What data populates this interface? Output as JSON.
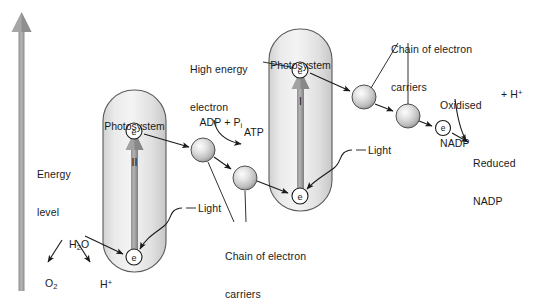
{
  "figure": {
    "background_color": "#ffffff",
    "ink_color": "#1a1a1a",
    "box_fill_light": "#f2f2f2",
    "box_fill_dark": "#c9c9c9",
    "box_stroke": "#555555",
    "sphere_fill": "#cfcfcf",
    "sphere_highlight": "#f0f0f0",
    "arrow_gray": "#9a9a9a"
  },
  "axis": {
    "label_line1": "Energy",
    "label_line2": "level",
    "icon": "upward-arrow-icon"
  },
  "photosystems": [
    {
      "id": "photosystem-ii",
      "name_line1": "Photosystem",
      "name_line2": "II",
      "electron_top_label": "e",
      "electron_bottom_label": "e",
      "internal_arrow": "excitation-arrow-up"
    },
    {
      "id": "photosystem-i",
      "name_line1": "Photosystem",
      "name_line2": "I",
      "electron_top_label": "e",
      "electron_bottom_label": "e",
      "internal_arrow": "excitation-arrow-up"
    }
  ],
  "labels": {
    "high_energy_electron_line1": "High energy",
    "high_energy_electron_line2": "electron",
    "adp_pi": "ADP + P",
    "adp_pi_subscript": "i",
    "atp": "ATP",
    "chain_left_line1": "Chain of electron",
    "chain_left_line2": "carriers",
    "chain_right_line1": "Chain of electron",
    "chain_right_line2": "carriers",
    "light_left": "Light",
    "light_right": "Light",
    "oxidised_nadp_line1": "Oxidised",
    "oxidised_nadp_line2": "NADP",
    "plus_h": "+ H",
    "plus_h_superscript": "+",
    "reduced_nadp_line1": "Reduced",
    "reduced_nadp_line2": "NADP",
    "water": "H",
    "water_sub": "2",
    "water_end": "O",
    "oxygen": "O",
    "oxygen_sub": "2",
    "proton": "H",
    "proton_sup": "+"
  },
  "electron_carriers": [
    {
      "id": "carrier-1",
      "cx": 203,
      "cy": 150,
      "r": 12
    },
    {
      "id": "carrier-2",
      "cx": 245,
      "cy": 178,
      "r": 12
    },
    {
      "id": "carrier-3",
      "cx": 364,
      "cy": 97,
      "r": 12
    },
    {
      "id": "carrier-4",
      "cx": 408,
      "cy": 116,
      "r": 12
    }
  ],
  "free_electrons": [
    {
      "id": "electron-psii-top",
      "cx": 134,
      "cy": 131
    },
    {
      "id": "electron-psii-bottom",
      "cx": 134,
      "cy": 257
    },
    {
      "id": "electron-psi-top",
      "cx": 300,
      "cy": 70
    },
    {
      "id": "electron-psi-bottom",
      "cx": 300,
      "cy": 196
    },
    {
      "id": "electron-to-nadp",
      "cx": 443,
      "cy": 128
    }
  ]
}
